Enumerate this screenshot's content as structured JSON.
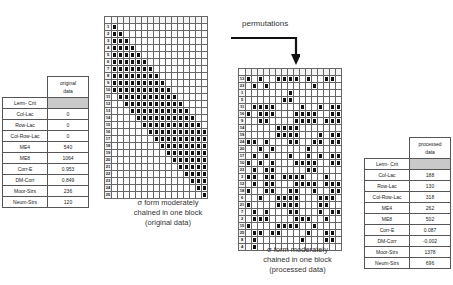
{
  "left_table": {
    "header": "original\ndata",
    "header_line1": "original",
    "header_line2": "data",
    "title_row": "Lerm- Crit",
    "rows": [
      {
        "label": "Col-Lac",
        "value": "0"
      },
      {
        "label": "Row-Lac",
        "value": "0"
      },
      {
        "label": "Col-Row-Lac",
        "value": "0"
      },
      {
        "label": "ME4",
        "value": "540"
      },
      {
        "label": "ME8",
        "value": "1064"
      },
      {
        "label": "Corr-E",
        "value": "0.953"
      },
      {
        "label": "DM-Corr",
        "value": "0.849"
      },
      {
        "label": "Moor-Strs",
        "value": "236"
      },
      {
        "label": "Neum-Strs",
        "value": "120"
      }
    ]
  },
  "right_table": {
    "header_line1": "processed",
    "header_line2": "data",
    "title_row": "Lerm- Crit",
    "rows": [
      {
        "label": "Col-Lac",
        "value": "188"
      },
      {
        "label": "Row-Lac",
        "value": "130"
      },
      {
        "label": "Col-Row-Lac",
        "value": "318"
      },
      {
        "label": "ME4",
        "value": "262"
      },
      {
        "label": "ME8",
        "value": "502"
      },
      {
        "label": "Corr-E",
        "value": "0.087"
      },
      {
        "label": "DM-Corr",
        "value": "-0.002"
      },
      {
        "label": "Moor-Strs",
        "value": "1378"
      },
      {
        "label": "Neum-Strs",
        "value": "696"
      }
    ]
  },
  "arrow": {
    "label": "permutations"
  },
  "left_matrix": {
    "caption_line1": "σ form moderately",
    "caption_line2": "chained in one block",
    "caption_line3": "(original data)",
    "row_labels": [
      "1",
      "2",
      "3",
      "4",
      "5",
      "6",
      "7",
      "8",
      "9",
      "10",
      "11",
      "12",
      "13",
      "14",
      "15",
      "16",
      "17",
      "18",
      "19",
      "20",
      "21",
      "22",
      "23",
      "24",
      "25"
    ],
    "rows": [
      "1000000000000000",
      "1100000000000000",
      "1110000000000000",
      "1111000000000000",
      "1111100000000000",
      "1111110000000000",
      "1111111000000000",
      "1111111100000000",
      "1111111110000000",
      "1111111111000000",
      "0111111111100000",
      "0011111111110000",
      "0001111111111000",
      "0000111111111100",
      "0000011111111110",
      "0000001111111111",
      "0000000111111111",
      "0000000011111111",
      "0000000001111111",
      "0000000000111111",
      "0000000000011111",
      "0000000000001111",
      "0000000000000111",
      "0000000000000011",
      "0000000000000001"
    ]
  },
  "right_matrix": {
    "caption_line1": "σ form moderately",
    "caption_line2": "chained in one block",
    "caption_line3": "(processed data)",
    "row_labels": [
      "13",
      "23",
      "1",
      "5",
      "11",
      "16",
      "9",
      "14",
      "19",
      "24",
      "20",
      "17",
      "10",
      "22",
      "3",
      "12",
      "18",
      "6",
      "21",
      "7",
      "2",
      "15",
      "25",
      "8",
      "4"
    ],
    "rows": [
      "1010011110100110",
      "0101000000010000",
      "0000000100000000",
      "0000001100000000",
      "0111100001001011",
      "1011100011110011",
      "0011000011110111",
      "0000011110000000",
      "0000011110001011",
      "1101000110011011",
      "0010100000100000",
      "0101000100101011",
      "1010100011110011",
      "0101100000110000",
      "1101101111000100",
      "0101100011110111",
      "1001100110010011",
      "0010011110001110",
      "1000011110001100",
      "0101000110001011",
      "0111000011100100",
      "1000011110010000",
      "0110110000100110",
      "0100000001000110",
      "0100000000000000"
    ]
  }
}
